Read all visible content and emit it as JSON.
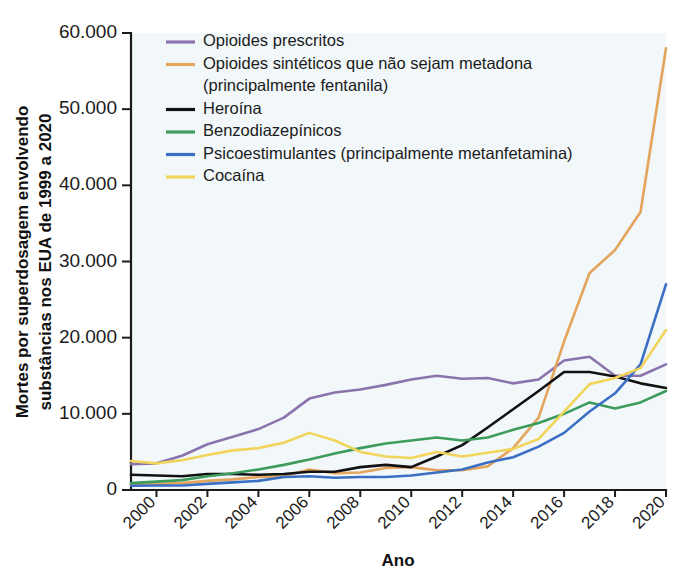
{
  "chart_data": {
    "type": "line",
    "title": "",
    "xlabel": "Ano",
    "ylabel": "Mortes por superdosagem envolvendo substâncias nos EUA de 1999 a 2020",
    "ylabel_line1": "Mortes por superdosagem envolvendo",
    "ylabel_line2": "substâncias nos EUA de 1999 a 2020",
    "xlim": [
      1999,
      2020
    ],
    "ylim": [
      0,
      60000
    ],
    "grid": false,
    "legend_position": "top-left-inside",
    "x": [
      1999,
      2000,
      2001,
      2002,
      2003,
      2004,
      2005,
      2006,
      2007,
      2008,
      2009,
      2010,
      2011,
      2012,
      2013,
      2014,
      2015,
      2016,
      2017,
      2018,
      2019,
      2020
    ],
    "xticks": [
      "2000",
      "2002",
      "2004",
      "2006",
      "2008",
      "2010",
      "2012",
      "2014",
      "2016",
      "2018",
      "2020"
    ],
    "xtick_values": [
      2000,
      2002,
      2004,
      2006,
      2008,
      2010,
      2012,
      2014,
      2016,
      2018,
      2020
    ],
    "yticks": [
      "0",
      "10.000",
      "20.000",
      "30.000",
      "40.000",
      "50.000",
      "60.000"
    ],
    "ytick_values": [
      0,
      10000,
      20000,
      30000,
      40000,
      50000,
      60000
    ],
    "series": [
      {
        "name": "Opioides prescritos",
        "color": "#8b74ae",
        "values": [
          3400,
          3500,
          4500,
          6000,
          7000,
          8000,
          9500,
          12000,
          12800,
          13200,
          13800,
          14500,
          15000,
          14600,
          14700,
          14000,
          14500,
          17000,
          17500,
          15000,
          15000,
          16500
        ]
      },
      {
        "name": "Opioides sintéticos que não sejam metadona (principalmente fentanila)",
        "color": "#e3a45c",
        "values": [
          700,
          800,
          900,
          1200,
          1400,
          1700,
          1800,
          2700,
          2200,
          2300,
          2900,
          3000,
          2600,
          2600,
          3100,
          5500,
          9500,
          19500,
          28500,
          31500,
          36500,
          58000
        ]
      },
      {
        "name": "Heroína",
        "color": "#111111",
        "values": [
          2000,
          1900,
          1800,
          2100,
          2100,
          2000,
          2100,
          2400,
          2400,
          3000,
          3300,
          3000,
          4400,
          5900,
          8200,
          10600,
          13000,
          15500,
          15500,
          14900,
          14000,
          13400
        ]
      },
      {
        "name": "Benzodiazepínicos",
        "color": "#3d9b5c",
        "values": [
          900,
          1100,
          1300,
          1800,
          2200,
          2700,
          3300,
          4000,
          4800,
          5500,
          6100,
          6500,
          6900,
          6500,
          6900,
          7900,
          8800,
          10000,
          11500,
          10700,
          11500,
          13000
        ]
      },
      {
        "name": "Psicoestimulantes (principalmente metanfetamina)",
        "color": "#3a6fc4",
        "values": [
          550,
          600,
          600,
          800,
          1000,
          1200,
          1700,
          1800,
          1600,
          1700,
          1700,
          1900,
          2300,
          2700,
          3600,
          4300,
          5700,
          7500,
          10300,
          12700,
          16500,
          27000
        ]
      },
      {
        "name": "Cocaína",
        "color": "#f0d55a",
        "values": [
          3800,
          3500,
          3900,
          4600,
          5200,
          5500,
          6200,
          7500,
          6500,
          5000,
          4400,
          4200,
          5000,
          4400,
          4900,
          5400,
          6700,
          10300,
          13900,
          14700,
          16000,
          21000
        ]
      }
    ],
    "legend": [
      {
        "label": "Opioides prescritos",
        "color": "#8b74ae"
      },
      {
        "label": "Opioides sintéticos que não sejam metadona",
        "color": "#e3a45c"
      },
      {
        "label": "(principalmente fentanila)",
        "color": ""
      },
      {
        "label": "Heroína",
        "color": "#111111"
      },
      {
        "label": "Benzodiazepínicos",
        "color": "#3d9b5c"
      },
      {
        "label": "Psicoestimulantes (principalmente metanfetamina)",
        "color": "#3a6fc4"
      },
      {
        "label": "Cocaína",
        "color": "#f0d55a"
      }
    ]
  }
}
